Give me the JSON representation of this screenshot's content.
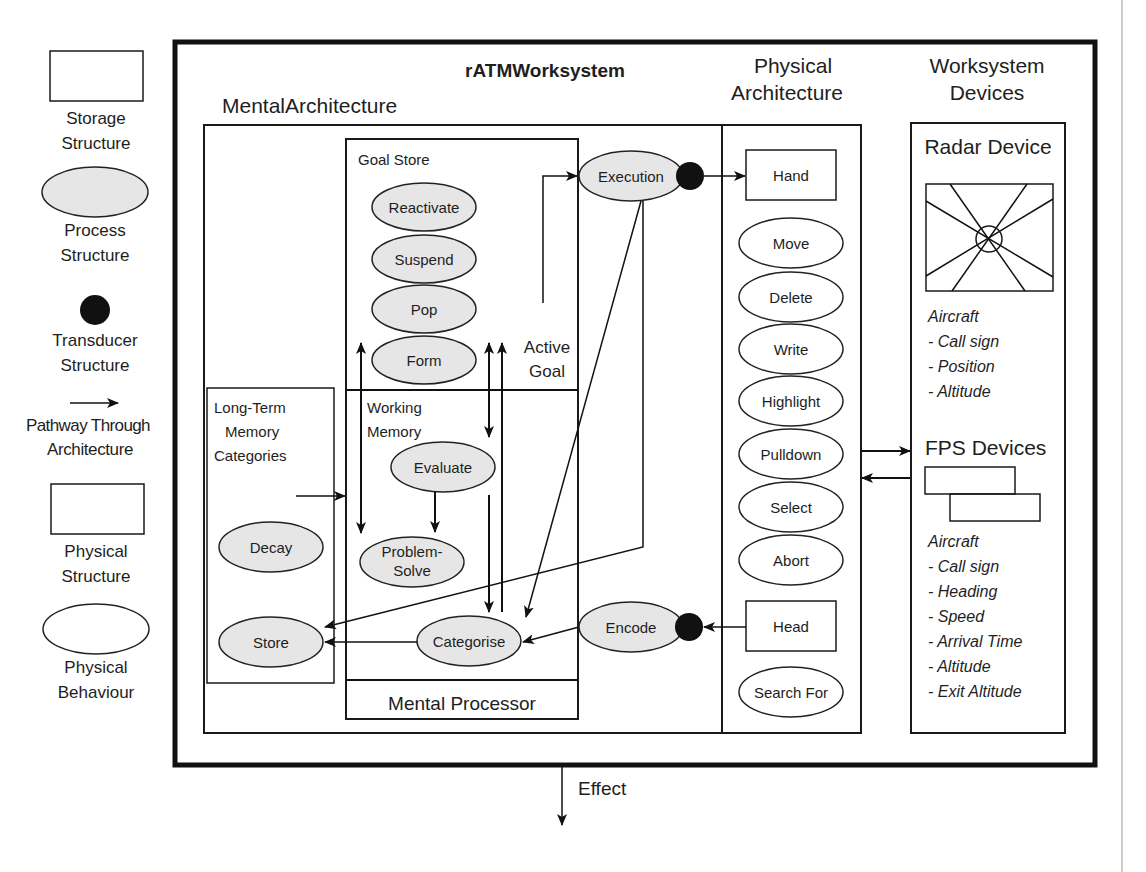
{
  "legend": {
    "items": [
      {
        "shape": "storage-rect",
        "label_line1": "Storage",
        "label_line2": "Structure"
      },
      {
        "shape": "process-ellipse",
        "label_line1": "Process",
        "label_line2": "Structure"
      },
      {
        "shape": "transducer-dot",
        "label_line1": "Transducer",
        "label_line2": "Structure"
      },
      {
        "shape": "pathway-arrow",
        "label_line1": "Pathway Through",
        "label_line2": "Architecture"
      },
      {
        "shape": "physical-rect",
        "label_line1": "Physical",
        "label_line2": "Structure"
      },
      {
        "shape": "behaviour-ellipse",
        "label_line1": "Physical",
        "label_line2": "Behaviour"
      }
    ]
  },
  "worksystem": {
    "title": "rATMWorksystem",
    "effect_label": "Effect"
  },
  "mental_architecture": {
    "title": "MentalArchitecture",
    "goal_store": {
      "title": "Goal Store",
      "processes": [
        "Reactivate",
        "Suspend",
        "Pop",
        "Form"
      ],
      "active_goal_line1": "Active",
      "active_goal_line2": "Goal"
    },
    "working_memory": {
      "title_line1": "Working",
      "title_line2": "Memory",
      "processes": [
        "Evaluate",
        "Problem-",
        "Solve",
        "Categorise"
      ]
    },
    "long_term_memory": {
      "title_line1": "Long-Term",
      "title_line2": "Memory",
      "title_line3": "Categories",
      "processes": [
        "Decay",
        "Store"
      ]
    },
    "mental_processor": "Mental Processor",
    "execution": "Execution",
    "encode": "Encode"
  },
  "physical_architecture": {
    "title_line1": "Physical",
    "title_line2": "Architecture",
    "structures": [
      "Hand",
      "Head"
    ],
    "behaviours": [
      "Move",
      "Delete",
      "Write",
      "Highlight",
      "Pulldown",
      "Select",
      "Abort",
      "Search For"
    ]
  },
  "worksystem_devices": {
    "title_line1": "Worksystem",
    "title_line2": "Devices",
    "radar": {
      "title": "Radar Device",
      "attributes": [
        "Aircraft",
        "- Call sign",
        "- Position",
        "- Altitude"
      ]
    },
    "fps": {
      "title": "FPS Devices",
      "attributes": [
        "Aircraft",
        "- Call sign",
        "- Heading",
        "- Speed",
        "- Arrival Time",
        "- Altitude",
        "- Exit Altitude"
      ]
    }
  }
}
